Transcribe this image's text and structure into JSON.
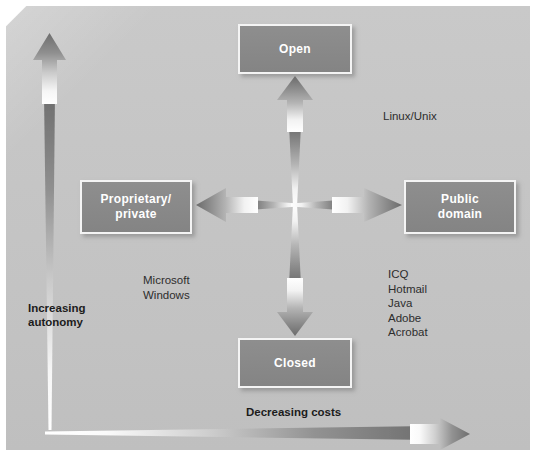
{
  "figure": {
    "caption": ""
  },
  "colors": {
    "background": "#c4c4c4",
    "node_fill": "#8a8a8a",
    "node_border": "#f4f4f4",
    "node_text": "#ffffff",
    "arrow_dark": "#6f6f6f",
    "arrow_light": "#ffffff",
    "note_text": "#2d2d2d",
    "axis_label_text": "#1c1c1c"
  },
  "nodes": [
    {
      "id": "open",
      "label": "Open",
      "position": "top"
    },
    {
      "id": "prop",
      "label": "Proprietary/\nprivate",
      "position": "left"
    },
    {
      "id": "public",
      "label": "Public\ndomain",
      "position": "right"
    },
    {
      "id": "closed",
      "label": "Closed",
      "position": "bottom"
    }
  ],
  "axes": {
    "y": {
      "label": "Increasing\nautonomy",
      "direction": "up"
    },
    "x": {
      "label": "Decreasing costs",
      "direction": "right"
    }
  },
  "annotations": [
    {
      "id": "linux",
      "text": "Linux/Unix",
      "near": "open-right"
    },
    {
      "id": "microsoft",
      "text": "Microsoft\nWindows",
      "near": "closed-left"
    },
    {
      "id": "examples",
      "text": "ICQ\nHotmail\nJava\nAdobe\nAcrobat",
      "near": "public-below"
    }
  ],
  "cross_arrows": [
    {
      "id": "up",
      "direction": "up",
      "from": "center",
      "to": "open"
    },
    {
      "id": "down",
      "direction": "down",
      "from": "center",
      "to": "closed"
    },
    {
      "id": "left",
      "direction": "left",
      "from": "center",
      "to": "prop"
    },
    {
      "id": "right",
      "direction": "right",
      "from": "center",
      "to": "public"
    }
  ]
}
